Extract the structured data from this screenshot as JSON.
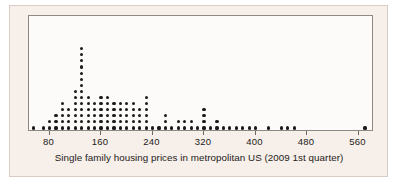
{
  "figure": {
    "caption": "Single family housing prices in metropolitan US (2009 1st quarter)",
    "background_color": "#f7efe9",
    "plot_background_color": "#fdfbf9",
    "frame_color": "#8e8880",
    "dot_color": "#1d1b19"
  },
  "axis": {
    "ticks": [
      80,
      160,
      240,
      320,
      400,
      480,
      560
    ],
    "tick_labels": [
      "80",
      "160",
      "240",
      "320",
      "400",
      "480",
      "560"
    ],
    "min": 48,
    "max": 584
  },
  "chart_data": {
    "type": "scatter",
    "plot_kind": "dotplot",
    "title": "",
    "subtitle": "",
    "xlabel": "Single family housing prices in metropolitan US (2009 1st quarter)",
    "ylabel": "",
    "xlim": [
      48,
      584
    ],
    "ylim": [
      0,
      15
    ],
    "grid": false,
    "legend": null,
    "bin_width": 10,
    "dot_stack_note": "Each dot represents one metropolitan area; dots are stacked vertically within a price bin.",
    "categories": [
      55,
      70,
      80,
      90,
      100,
      110,
      120,
      130,
      140,
      150,
      160,
      170,
      180,
      190,
      200,
      210,
      220,
      230,
      240,
      250,
      260,
      270,
      280,
      290,
      300,
      310,
      320,
      330,
      340,
      350,
      360,
      370,
      380,
      390,
      400,
      420,
      440,
      450,
      460,
      570
    ],
    "values": [
      1,
      1,
      2,
      3,
      5,
      4,
      7,
      14,
      6,
      5,
      6,
      6,
      5,
      5,
      5,
      5,
      4,
      6,
      1,
      1,
      3,
      1,
      2,
      2,
      2,
      1,
      4,
      1,
      2,
      1,
      1,
      1,
      1,
      1,
      1,
      1,
      1,
      1,
      1,
      1
    ],
    "series": [
      {
        "name": "Metropolitan areas",
        "x": [
          55,
          70,
          80,
          90,
          100,
          110,
          120,
          130,
          140,
          150,
          160,
          170,
          180,
          190,
          200,
          210,
          220,
          230,
          240,
          250,
          260,
          270,
          280,
          290,
          300,
          310,
          320,
          330,
          340,
          350,
          360,
          370,
          380,
          390,
          400,
          420,
          440,
          450,
          460,
          570
        ],
        "counts": [
          1,
          1,
          2,
          3,
          5,
          4,
          7,
          14,
          6,
          5,
          6,
          6,
          5,
          5,
          5,
          5,
          4,
          6,
          1,
          1,
          3,
          1,
          2,
          2,
          2,
          1,
          4,
          1,
          2,
          1,
          1,
          1,
          1,
          1,
          1,
          1,
          1,
          1,
          1,
          1
        ]
      }
    ],
    "peak": {
      "x": 130,
      "count": 14
    },
    "total_dots": 115
  }
}
